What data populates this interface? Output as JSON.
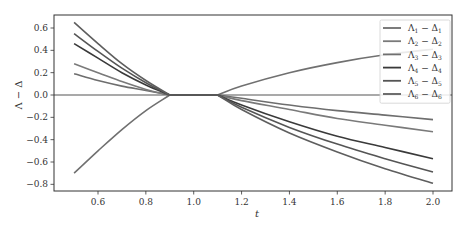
{
  "chart_data": {
    "type": "line",
    "title": "",
    "xlabel": "t",
    "ylabel": "Λ − Δ",
    "xlim": [
      0.44,
      2.07
    ],
    "ylim": [
      -0.86,
      0.72
    ],
    "xticks": [
      0.6,
      0.8,
      1.0,
      1.2,
      1.4,
      1.6,
      1.8,
      2.0
    ],
    "xtick_labels": [
      "0.6",
      "0.8",
      "1.0",
      "1.2",
      "1.4",
      "1.6",
      "1.8",
      "2.0"
    ],
    "yticks": [
      -0.8,
      -0.6,
      -0.4,
      -0.2,
      0.0,
      0.2,
      0.4,
      0.6
    ],
    "ytick_labels": [
      "−0.8",
      "−0.6",
      "−0.4",
      "−0.2",
      "0.0",
      "0.2",
      "0.4",
      "0.6"
    ],
    "grid": false,
    "legend_position": "upper right",
    "x": [
      0.5,
      0.6,
      0.7,
      0.8,
      0.9,
      1.0,
      1.1,
      1.2,
      1.4,
      1.6,
      1.8,
      2.0
    ],
    "series": [
      {
        "name": "Λ₁ − Δ₁",
        "color": "#6e6e6e",
        "values": [
          0.19,
          0.13,
          0.08,
          0.04,
          0.0,
          0.0,
          0.0,
          -0.03,
          -0.09,
          -0.14,
          -0.18,
          -0.22
        ]
      },
      {
        "name": "Λ₂ − Δ₂",
        "color": "#7a7a7a",
        "values": [
          0.28,
          0.2,
          0.12,
          0.05,
          0.0,
          0.0,
          0.0,
          -0.05,
          -0.13,
          -0.21,
          -0.27,
          -0.33
        ]
      },
      {
        "name": "Λ₃ − Δ₃",
        "color": "#707070",
        "values": [
          -0.7,
          -0.5,
          -0.31,
          -0.14,
          0.0,
          0.0,
          0.0,
          0.08,
          0.2,
          0.29,
          0.36,
          0.41
        ]
      },
      {
        "name": "Λ₄ − Δ₄",
        "color": "#3a3a3a",
        "values": [
          0.46,
          0.33,
          0.2,
          0.09,
          0.0,
          0.0,
          0.0,
          -0.09,
          -0.24,
          -0.37,
          -0.47,
          -0.57
        ]
      },
      {
        "name": "Λ₅ − Δ₅",
        "color": "#555555",
        "values": [
          0.55,
          0.39,
          0.24,
          0.11,
          0.0,
          0.0,
          0.0,
          -0.11,
          -0.29,
          -0.44,
          -0.57,
          -0.69
        ]
      },
      {
        "name": "Λ₆ − Δ₆",
        "color": "#5e5e5e",
        "values": [
          0.65,
          0.46,
          0.28,
          0.13,
          0.0,
          0.0,
          0.0,
          -0.13,
          -0.34,
          -0.51,
          -0.66,
          -0.79
        ]
      }
    ],
    "legend": [
      {
        "label_main": "Λ",
        "sub1": "1",
        "mid": " − Δ",
        "sub2": "1",
        "color": "#6e6e6e"
      },
      {
        "label_main": "Λ",
        "sub1": "2",
        "mid": " − Δ",
        "sub2": "2",
        "color": "#7a7a7a"
      },
      {
        "label_main": "Λ",
        "sub1": "3",
        "mid": " − Δ",
        "sub2": "3",
        "color": "#707070"
      },
      {
        "label_main": "Λ",
        "sub1": "4",
        "mid": " − Δ",
        "sub2": "4",
        "color": "#3a3a3a"
      },
      {
        "label_main": "Λ",
        "sub1": "5",
        "mid": " − Δ",
        "sub2": "5",
        "color": "#555555"
      },
      {
        "label_main": "Λ",
        "sub1": "6",
        "mid": " − Δ",
        "sub2": "6",
        "color": "#5e5e5e"
      }
    ],
    "zero_line": true
  }
}
